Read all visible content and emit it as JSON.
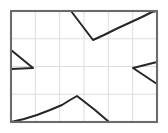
{
  "figure": {
    "title": "",
    "background_color": "#ffffff",
    "width": 168,
    "height": 133
  },
  "chart_data": {
    "type": "line",
    "title": "",
    "subtitle": "",
    "xlabel": "",
    "ylabel": "",
    "xlim": [
      0,
      6
    ],
    "ylim": [
      0,
      4
    ],
    "grid": true,
    "grid_color": "#d9d9d9",
    "grid_columns": 6,
    "grid_rows": 4,
    "x_tick_labels": [],
    "y_tick_labels": [],
    "legend": {
      "visible": false,
      "position": "none",
      "entries": []
    },
    "axes_frame": {
      "visible": true,
      "color": "#6b6b6b",
      "x_left": 11,
      "x_right": 157,
      "y_top": 11,
      "y_bottom": 122
    },
    "annotations": [],
    "series": [
      {
        "name": "top-notch",
        "color": "#262626",
        "style": "solid",
        "description": "descending segment from top edge to V vertex then rising curve to top-right corner",
        "points_px": [
          [
            71,
            11
          ],
          [
            93,
            40
          ],
          [
            104,
            35
          ],
          [
            116,
            29
          ],
          [
            129,
            23
          ],
          [
            142,
            17
          ],
          [
            152,
            12
          ],
          [
            157,
            11
          ]
        ]
      },
      {
        "name": "bottom-peak",
        "color": "#262626",
        "style": "solid",
        "description": "concave rising curve from bottom-left corner to peak then straight descent to bottom edge",
        "points_px": [
          [
            11,
            122
          ],
          [
            24,
            119
          ],
          [
            37,
            115
          ],
          [
            50,
            110
          ],
          [
            62,
            105
          ],
          [
            70,
            100
          ],
          [
            77,
            96
          ],
          [
            95,
            110
          ],
          [
            109,
            122
          ]
        ]
      },
      {
        "name": "left-wedge",
        "color": "#262626",
        "style": "solid",
        "description": "triangular wedge pointing right from the left border",
        "points_px": [
          [
            11,
            50
          ],
          [
            33,
            68
          ],
          [
            11,
            69
          ]
        ]
      },
      {
        "name": "right-wedge",
        "color": "#262626",
        "style": "solid",
        "description": "triangular wedge pointing left from the right border",
        "points_px": [
          [
            157,
            62
          ],
          [
            133,
            68
          ],
          [
            157,
            84
          ]
        ]
      }
    ]
  }
}
